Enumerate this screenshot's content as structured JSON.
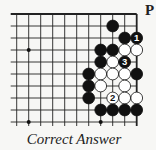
{
  "diagram": {
    "type": "go-problem",
    "caption": "Correct Answer",
    "side_letter": "P",
    "grid": {
      "origin_x": 16.7,
      "origin_y": 14,
      "spacing": 12,
      "cols": 11,
      "rows": 10,
      "left_extension": 6,
      "bottom_extension": 4,
      "edges": {
        "top": true,
        "right": true,
        "left": false,
        "bottom": false
      }
    },
    "colors": {
      "black": "#111111",
      "white": "#ffffff",
      "line": "#222222",
      "background": "#f7f7f5"
    },
    "star_points": [
      {
        "col": 1,
        "row": 3
      },
      {
        "col": 1,
        "row": 9
      },
      {
        "col": 7,
        "row": 9
      }
    ],
    "stones": [
      {
        "col": 8,
        "row": 1,
        "color": "black"
      },
      {
        "col": 9,
        "row": 2,
        "color": "black"
      },
      {
        "col": 10,
        "row": 2,
        "color": "black",
        "label": "1"
      },
      {
        "col": 7,
        "row": 3,
        "color": "black"
      },
      {
        "col": 8,
        "row": 3,
        "color": "black"
      },
      {
        "col": 9,
        "row": 3,
        "color": "white"
      },
      {
        "col": 10,
        "row": 3,
        "color": "white"
      },
      {
        "col": 7,
        "row": 4,
        "color": "black"
      },
      {
        "col": 8,
        "row": 4,
        "color": "white"
      },
      {
        "col": 9,
        "row": 4,
        "color": "black",
        "label": "3"
      },
      {
        "col": 6,
        "row": 5,
        "color": "black"
      },
      {
        "col": 7,
        "row": 5,
        "color": "white"
      },
      {
        "col": 8,
        "row": 5,
        "color": "white"
      },
      {
        "col": 9,
        "row": 5,
        "color": "white"
      },
      {
        "col": 10,
        "row": 5,
        "color": "black"
      },
      {
        "col": 6,
        "row": 6,
        "color": "black"
      },
      {
        "col": 7,
        "row": 6,
        "color": "white"
      },
      {
        "col": 9,
        "row": 6,
        "color": "white"
      },
      {
        "col": 6,
        "row": 7,
        "color": "black"
      },
      {
        "col": 8,
        "row": 7,
        "color": "white",
        "label": "2"
      },
      {
        "col": 9,
        "row": 7,
        "color": "white"
      },
      {
        "col": 10,
        "row": 7,
        "color": "white"
      },
      {
        "col": 7,
        "row": 8,
        "color": "black"
      },
      {
        "col": 8,
        "row": 8,
        "color": "black"
      },
      {
        "col": 9,
        "row": 8,
        "color": "black"
      },
      {
        "col": 10,
        "row": 8,
        "color": "black"
      }
    ]
  }
}
